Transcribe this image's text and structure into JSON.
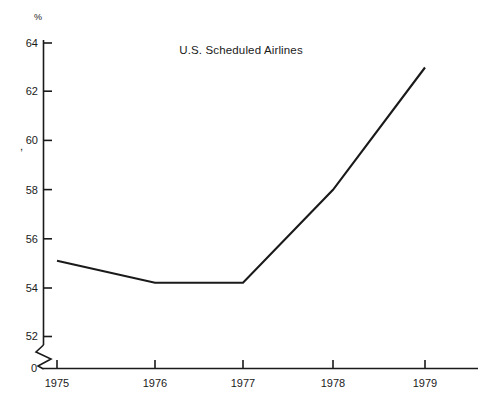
{
  "chart_data": {
    "type": "line",
    "title": "U.S. Scheduled Airlines",
    "xlabel": "",
    "ylabel": "%",
    "categories": [
      "1975",
      "1976",
      "1977",
      "1978",
      "1979"
    ],
    "x": [
      1975,
      1976,
      1977,
      1978,
      1979
    ],
    "values": [
      55.1,
      54.2,
      54.2,
      58.0,
      63.0
    ],
    "series": [
      {
        "name": "U.S. Scheduled Airlines",
        "values": [
          55.1,
          54.2,
          54.2,
          58.0,
          63.0
        ]
      }
    ],
    "ylim": [
      52,
      64
    ],
    "yticks": [
      52,
      54,
      56,
      58,
      60,
      62,
      64
    ],
    "ytick_labels": [
      "52",
      "54",
      "56",
      "58",
      "60",
      "62",
      "64"
    ],
    "xticks": [
      1975,
      1976,
      1977,
      1978,
      1979
    ],
    "xtick_labels": [
      "1975",
      "1976",
      "1977",
      "1978",
      "1979"
    ],
    "axis_break": true,
    "axis_break_label": "0",
    "grid": false,
    "legend": "none",
    "line_color": "#1a1a1a",
    "axis_color": "#1a1a1a"
  },
  "annotations": {
    "percent_symbol": "%",
    "origin_label": "0",
    "stray_comma": ","
  }
}
